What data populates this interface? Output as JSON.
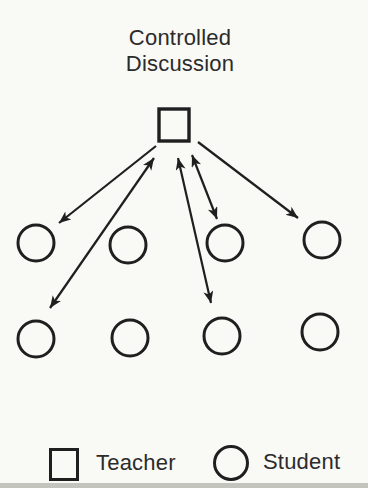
{
  "title": {
    "text": "Controlled Discussion",
    "line1": "Controlled",
    "line2": "Discussion"
  },
  "colors": {
    "ink": "#1f1f1f",
    "text": "#2b2b2b",
    "paper": "#f9f9f6",
    "scan_edge": "#c4c4bf"
  },
  "diagram": {
    "teacher_node": {
      "shape": "square",
      "x": 159,
      "y": 109,
      "width": 30,
      "height": 32
    },
    "student_radius": 18,
    "student_nodes": [
      {
        "row": 1,
        "cx": 36,
        "cy": 243
      },
      {
        "row": 1,
        "cx": 128,
        "cy": 245
      },
      {
        "row": 1,
        "cx": 225,
        "cy": 243
      },
      {
        "row": 1,
        "cx": 322,
        "cy": 240
      },
      {
        "row": 2,
        "cx": 36,
        "cy": 339
      },
      {
        "row": 2,
        "cx": 130,
        "cy": 338
      },
      {
        "row": 2,
        "cx": 222,
        "cy": 336
      },
      {
        "row": 2,
        "cx": 320,
        "cy": 332
      }
    ],
    "arrows": [
      {
        "from": [
          156,
          146
        ],
        "to": [
          59,
          223
        ],
        "heads": "end"
      },
      {
        "from": [
          154,
          158
        ],
        "to": [
          50,
          308
        ],
        "heads": "both"
      },
      {
        "from": [
          178,
          158
        ],
        "to": [
          211,
          303
        ],
        "heads": "both"
      },
      {
        "from": [
          192,
          155
        ],
        "to": [
          217,
          219
        ],
        "heads": "both"
      },
      {
        "from": [
          198,
          142
        ],
        "to": [
          298,
          218
        ],
        "heads": "end"
      }
    ]
  },
  "legend": {
    "items": [
      {
        "symbol": "square",
        "label": "Teacher"
      },
      {
        "symbol": "circle",
        "label": "Student"
      }
    ]
  }
}
